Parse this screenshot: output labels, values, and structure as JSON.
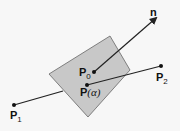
{
  "diagram": {
    "labels": {
      "normal": "n",
      "p0_main": "P",
      "p0_sub": "0",
      "p_alpha_main": "P",
      "p_alpha_param": "(α)",
      "p1_main": "P",
      "p1_sub": "1",
      "p2_main": "P",
      "p2_sub": "2"
    },
    "colors": {
      "plane_fill": "#c8c8c8",
      "plane_stroke": "#666666",
      "line": "#222222",
      "background": "#f7f7f7"
    }
  }
}
